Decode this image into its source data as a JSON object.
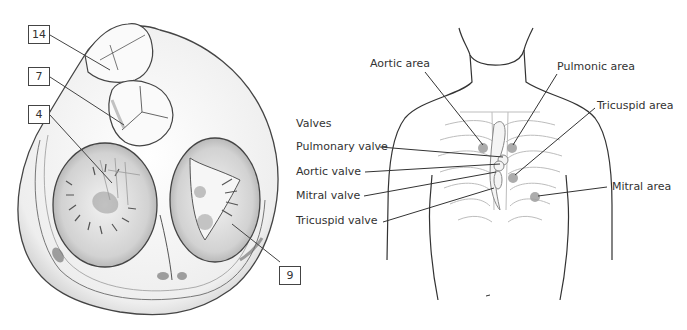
{
  "left_figure": {
    "title": "Cross-section of heart valves (base of heart)",
    "callouts": [
      {
        "id": "14",
        "label": "14"
      },
      {
        "id": "7",
        "label": "7"
      },
      {
        "id": "4",
        "label": "4"
      },
      {
        "id": "9",
        "label": "9"
      }
    ]
  },
  "right_figure": {
    "heading": "Valves",
    "valves": [
      {
        "label": "Pulmonary valve"
      },
      {
        "label": "Aortic valve"
      },
      {
        "label": "Mitral valve"
      },
      {
        "label": "Tricuspid valve"
      }
    ],
    "areas": [
      {
        "label": "Aortic area"
      },
      {
        "label": "Pulmonic area"
      },
      {
        "label": "Tricuspid area"
      },
      {
        "label": "Mitral area"
      }
    ],
    "colors": {
      "line": "#333333",
      "rib": "#bdbdbd",
      "area_dot": "#9e9e9e"
    }
  }
}
